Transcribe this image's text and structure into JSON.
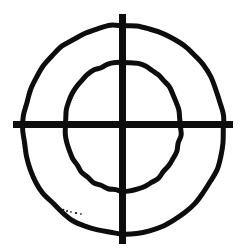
{
  "image": {
    "title": "Crosshair target symbol",
    "subject": "hand-drawn reticle / bullseye",
    "width": 242,
    "height": 251,
    "background_color": "#ffffff",
    "ink_color": "#0d0d0d",
    "style": "black ink line drawing on white paper, scanned"
  },
  "figure": {
    "center": {
      "x": 122.5,
      "y": 124.5
    },
    "outer_circle": {
      "name": "outer-ring",
      "shape": "irregular circle",
      "left": 23,
      "right": 224,
      "top": 25,
      "bottom": 234,
      "radius_x": 100,
      "radius_y": 104,
      "stroke_width": 5,
      "stroke_color": "#0d0d0d",
      "fill": "none"
    },
    "inner_circle": {
      "name": "inner-ring",
      "shape": "egg-shaped oval",
      "left": 65,
      "right": 181,
      "top": 62,
      "bottom": 191,
      "radius_x": 58,
      "radius_y": 64,
      "stroke_width": 5,
      "stroke_color": "#0d0d0d",
      "fill": "none"
    },
    "vertical_bar": {
      "name": "vertical-crosshair",
      "x_left": 119,
      "x_right": 126,
      "y_top": 14,
      "y_bottom": 244,
      "thickness": 7,
      "length": 230,
      "color": "#0d0d0d"
    },
    "horizontal_bar": {
      "name": "horizontal-crosshair",
      "y_top": 121,
      "y_bottom": 128,
      "x_left": 13,
      "x_right": 233,
      "thickness": 7,
      "length": 220,
      "color": "#0d0d0d"
    },
    "speckles": {
      "name": "ink-speckles",
      "description": "small scattered ink marks near lower-left outer arc",
      "color": "#1a1a1a",
      "marks": [
        {
          "cx": 63,
          "cy": 210,
          "rx": 1.6,
          "ry": 1.0,
          "rot": -22
        },
        {
          "cx": 67,
          "cy": 211,
          "rx": 1.2,
          "ry": 0.8,
          "rot": -18
        },
        {
          "cx": 71,
          "cy": 212,
          "rx": 1.0,
          "ry": 0.7,
          "rot": -15
        },
        {
          "cx": 76,
          "cy": 213,
          "rx": 1.3,
          "ry": 0.9,
          "rot": -12
        },
        {
          "cx": 81,
          "cy": 214,
          "rx": 1.0,
          "ry": 0.7,
          "rot": -10
        },
        {
          "cx": 59,
          "cy": 208,
          "rx": 1.0,
          "ry": 0.7,
          "rot": -26
        }
      ]
    }
  },
  "labels": {
    "alt_text": "A black hand-drawn crosshair target: two concentric rings crossed by a thick vertical and horizontal line."
  }
}
